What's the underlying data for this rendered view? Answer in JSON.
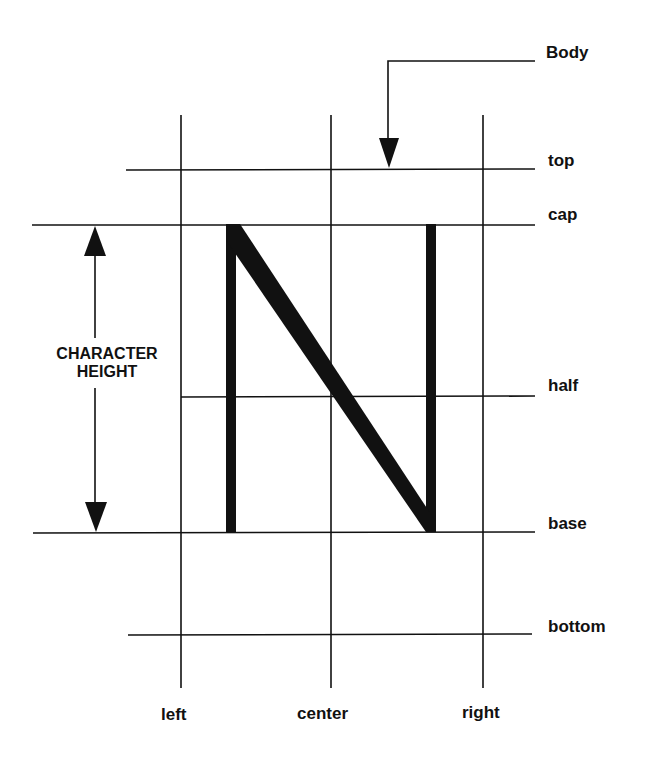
{
  "diagram": {
    "horizontal_lines": [
      {
        "id": "top",
        "label": "top"
      },
      {
        "id": "cap",
        "label": "cap"
      },
      {
        "id": "half",
        "label": "half"
      },
      {
        "id": "base",
        "label": "base"
      },
      {
        "id": "bottom",
        "label": "bottom"
      }
    ],
    "vertical_lines": [
      {
        "id": "left",
        "label": "left"
      },
      {
        "id": "center",
        "label": "center"
      },
      {
        "id": "right",
        "label": "right"
      }
    ],
    "body_label": "Body",
    "character_height_label_line1": "CHARACTER",
    "character_height_label_line2": "HEIGHT",
    "glyph": "N",
    "colors": {
      "ink": "#111111",
      "background": "#ffffff"
    }
  }
}
